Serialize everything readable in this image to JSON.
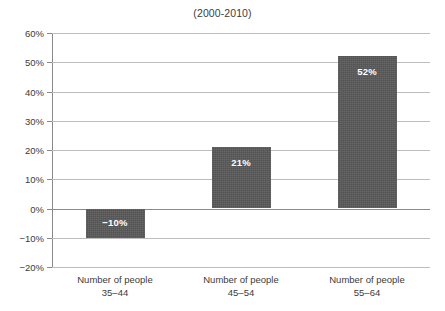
{
  "chart_data": {
    "type": "bar",
    "title": "(2000-2010)",
    "xlabel": "",
    "ylabel": "",
    "categories": [
      "Number of people\n35–44",
      "Number of people\n45–54",
      "Number of people\n55–64"
    ],
    "category_lines": [
      {
        "line1": "Number of people",
        "line2": "35–44"
      },
      {
        "line1": "Number of people",
        "line2": "45–54"
      },
      {
        "line1": "Number of people",
        "line2": "55–64"
      }
    ],
    "values": [
      -10,
      21,
      52
    ],
    "value_labels": [
      "−10%",
      "21%",
      "52%"
    ],
    "ylim": [
      -20,
      60
    ],
    "ytick_step": 10,
    "ytick_labels": [
      "60%",
      "50%",
      "40%",
      "30%",
      "20%",
      "10%",
      "0%",
      "−10%",
      "−20%"
    ],
    "ytick_values": [
      60,
      50,
      40,
      30,
      20,
      10,
      0,
      -10,
      -20
    ],
    "grid": true,
    "legend": false,
    "legend_position": "none",
    "colors": {
      "bar_fill": "#585858",
      "grid": "#bdbdbd",
      "zero_line": "#8a8a8a",
      "axis": "#8a8a8a",
      "text": "#3b3b3b",
      "value_label": "#ffffff",
      "background": "#ffffff"
    }
  }
}
